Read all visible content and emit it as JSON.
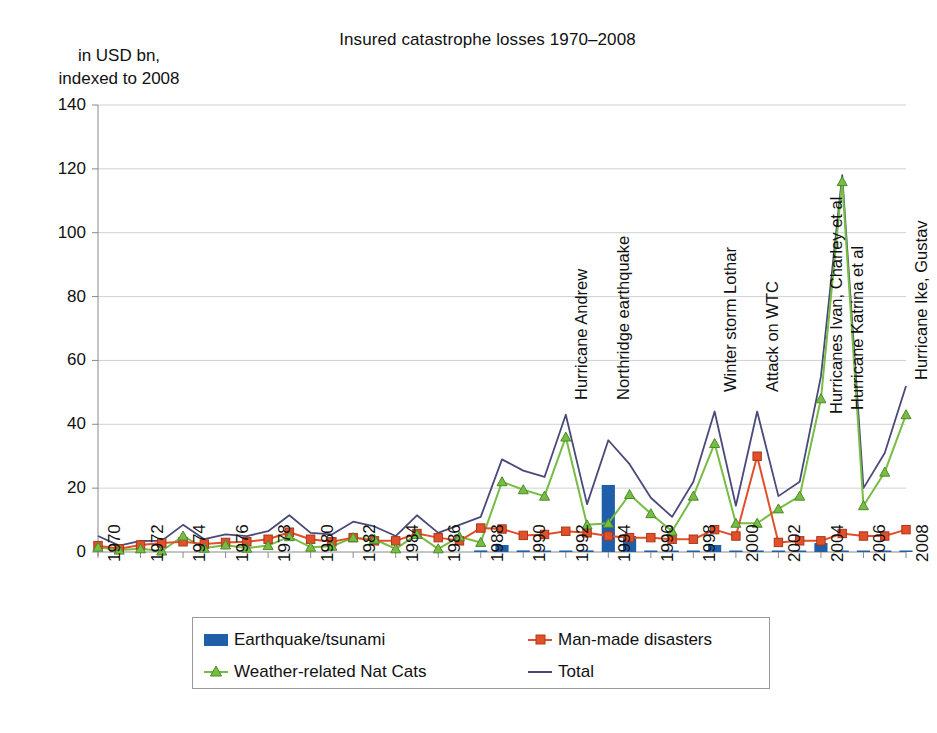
{
  "title": "Insured catastrophe losses 1970–2008",
  "axis_caption": "in USD bn,\nindexed to 2008",
  "legend": {
    "items": [
      {
        "label": "Earthquake/tsunami",
        "icon": "bar-swatch-icon",
        "color": "#1F5FA9"
      },
      {
        "label": "Man-made disasters",
        "icon": "line-square-marker-icon",
        "color": "#E1502A"
      },
      {
        "label": "Weather-related Nat Cats",
        "icon": "line-triangle-marker-icon",
        "color": "#77BC43"
      },
      {
        "label": "Total",
        "icon": "plain-line-icon",
        "color": "#4A4A7A"
      }
    ]
  },
  "chart_data": {
    "type": "line",
    "title": "Insured catastrophe losses 1970–2008",
    "subtitle": "in USD bn, indexed to 2008",
    "xlabel": "",
    "ylabel": "in USD bn, indexed to 2008",
    "ylim": [
      0,
      140
    ],
    "ytick_step": 20,
    "yticks": [
      0,
      20,
      40,
      60,
      80,
      100,
      120,
      140
    ],
    "grid": true,
    "legend_position": "bottom",
    "x": [
      1970,
      1971,
      1972,
      1973,
      1974,
      1975,
      1976,
      1977,
      1978,
      1979,
      1980,
      1981,
      1982,
      1983,
      1984,
      1985,
      1986,
      1987,
      1988,
      1989,
      1990,
      1991,
      1992,
      1993,
      1994,
      1995,
      1996,
      1997,
      1998,
      1999,
      2000,
      2001,
      2002,
      2003,
      2004,
      2005,
      2006,
      2007,
      2008
    ],
    "xtick_labels": [
      "1970",
      "1972",
      "1974",
      "1976",
      "1978",
      "1980",
      "1982",
      "1984",
      "1986",
      "1988",
      "1990",
      "1992",
      "1994",
      "1996",
      "1998",
      "2000",
      "2002",
      "2004",
      "2006",
      "2008"
    ],
    "series": [
      {
        "name": "Earthquake/tsunami",
        "type": "bar",
        "color": "#1F5FA9",
        "values": [
          0,
          0,
          0,
          0,
          0,
          0,
          0,
          0,
          0,
          0,
          0,
          0,
          0,
          0,
          0,
          0,
          0,
          0,
          0.5,
          2.2,
          0.5,
          0.3,
          0.4,
          0.5,
          21,
          5,
          0.4,
          0.3,
          0.4,
          2.2,
          0.3,
          0.2,
          0.3,
          0.3,
          2.8,
          0.4,
          0.2,
          0.3,
          0.2
        ]
      },
      {
        "name": "Man-made disasters",
        "type": "line",
        "marker": "square",
        "color": "#E1502A",
        "values": [
          2.0,
          1.0,
          2.2,
          2.8,
          3.2,
          2.5,
          3.0,
          3.2,
          4.0,
          6.2,
          4.0,
          3.2,
          4.5,
          3.5,
          3.5,
          5.8,
          4.5,
          3.5,
          7.5,
          7.2,
          5.2,
          5.5,
          6.5,
          6.0,
          5.0,
          4.5,
          4.5,
          4.0,
          4.0,
          7.0,
          5.0,
          30.0,
          3.0,
          3.5,
          3.5,
          5.8,
          5.0,
          5.0,
          7.0
        ]
      },
      {
        "name": "Weather-related Nat Cats",
        "type": "line",
        "marker": "triangle",
        "color": "#77BC43",
        "values": [
          1.5,
          0.6,
          1.0,
          0.3,
          5.0,
          1.2,
          2.2,
          1.2,
          2.0,
          4.8,
          1.5,
          1.8,
          4.5,
          4.0,
          1.0,
          5.5,
          1.0,
          4.8,
          3.0,
          22.0,
          19.5,
          17.5,
          36.0,
          8.5,
          9.0,
          18.0,
          12.0,
          6.5,
          17.5,
          34.0,
          9.0,
          9.0,
          13.5,
          17.5,
          48.0,
          116.0,
          14.5,
          25.0,
          43.0
        ]
      },
      {
        "name": "Total",
        "type": "line",
        "color": "#4A4A7A",
        "values": [
          5.0,
          2.0,
          3.5,
          3.5,
          8.5,
          4.0,
          5.5,
          5.0,
          6.5,
          11.5,
          6.0,
          5.5,
          9.5,
          8.0,
          5.0,
          11.5,
          6.0,
          8.5,
          11.0,
          29.0,
          25.5,
          23.5,
          43.0,
          15.0,
          35.0,
          27.5,
          17.0,
          11.0,
          22.0,
          44.0,
          14.5,
          44.0,
          17.5,
          22.0,
          55.0,
          118.0,
          20.0,
          31.0,
          52.0
        ]
      }
    ],
    "annotations": [
      {
        "text": "Hurricane Andrew",
        "year": 1992
      },
      {
        "text": "Northridge earthquake",
        "year": 1994
      },
      {
        "text": "Winter storm Lothar",
        "year": 1999
      },
      {
        "text": "Attack on WTC",
        "year": 2001
      },
      {
        "text": "Hurricanes Ivan, Charley et al",
        "year": 2004
      },
      {
        "text": "Hurricane Katrina et al",
        "year": 2005
      },
      {
        "text": "Hurricane Ike, Gustav",
        "year": 2008
      }
    ]
  }
}
